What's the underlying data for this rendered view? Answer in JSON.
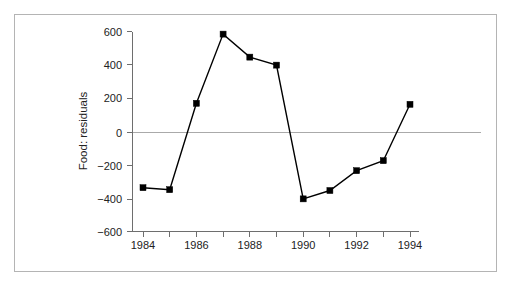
{
  "chart_data": {
    "type": "line",
    "title": "",
    "xlabel": "",
    "ylabel": "Food: residuals",
    "x": [
      1984,
      1985,
      1986,
      1987,
      1988,
      1989,
      1990,
      1991,
      1992,
      1993,
      1994
    ],
    "values": [
      -331,
      -343,
      175,
      590,
      452,
      404,
      -398,
      -348,
      -229,
      -169,
      169
    ],
    "series": [
      {
        "name": "Food: residuals",
        "values": [
          -331,
          -343,
          175,
          590,
          452,
          404,
          -398,
          -348,
          -229,
          -169,
          169
        ]
      }
    ],
    "xlim": [
      1983.5,
      1994.5
    ],
    "ylim": [
      -600,
      600
    ],
    "ytick_labels": [
      "600",
      "400",
      "200",
      "0",
      "−200",
      "−400",
      "−600"
    ],
    "ytick_values": [
      600,
      400,
      200,
      0,
      -200,
      -400,
      -600
    ],
    "xtick_labels": [
      "1984",
      "1986",
      "1988",
      "1990",
      "1992",
      "1994"
    ],
    "xtick_values": [
      1984,
      1986,
      1988,
      1990,
      1992,
      1994
    ],
    "xtick_minor_values": [
      1985,
      1987,
      1989,
      1991,
      1993
    ],
    "grid": false,
    "zero_reference_line": 0,
    "legend": "none",
    "marker": "filled-square",
    "colors": {
      "line": "#000000",
      "marker": "#000000",
      "axis": "#6e6e6e",
      "zero_line": "#aaaaaa",
      "frame": "#b4b4b4",
      "background": "#ffffff",
      "text": "#222222"
    }
  }
}
